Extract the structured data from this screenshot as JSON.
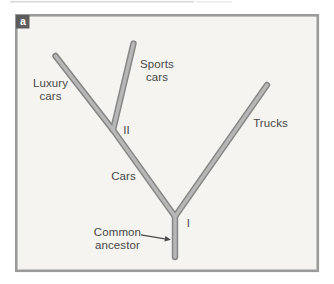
{
  "figure": {
    "panel_label": "a"
  },
  "colors": {
    "panel_bg": "#f5f4f1",
    "frame": "#9b9b9b",
    "branch_outline": "#868686",
    "branch_inner": "#b7b7b7",
    "badge_bg": "#5d5d5d",
    "badge_text": "#ffffff",
    "text": "#474747",
    "arrow": "#4a4a4a",
    "scan_artifact": "#c0c0c0"
  },
  "labels": {
    "luxury_line1": "Luxury",
    "luxury_line2": "cars",
    "sports_line1": "Sports",
    "sports_line2": "cars",
    "trucks": "Trucks",
    "cars": "Cars",
    "node_I": "I",
    "node_II": "II",
    "common_line1": "Common",
    "common_line2": "ancestor"
  },
  "tree": {
    "root": "Common ancestor",
    "nodes": [
      {
        "id": "I",
        "splits_into": [
          "Cars lineage",
          "Trucks"
        ]
      },
      {
        "id": "II",
        "splits_into": [
          "Luxury cars",
          "Sports cars"
        ]
      }
    ],
    "tips": [
      "Luxury cars",
      "Sports cars",
      "Trucks"
    ],
    "branch_labels": [
      "Cars"
    ]
  }
}
